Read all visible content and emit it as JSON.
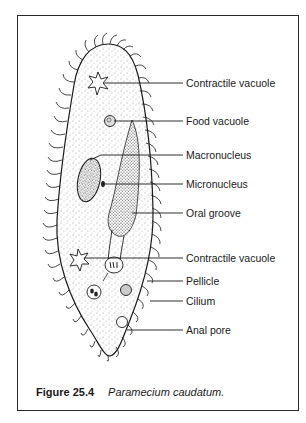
{
  "figure": {
    "number": "Figure 25.4",
    "title": "Paramecium caudatum."
  },
  "labels": [
    {
      "id": "contractile-vacuole-top",
      "text": "Contractile vacuole",
      "y": 83
    },
    {
      "id": "food-vacuole",
      "text": "Food vacuole",
      "y": 121
    },
    {
      "id": "macronucleus",
      "text": "Macronucleus",
      "y": 155
    },
    {
      "id": "micronucleus",
      "text": "Micronucleus",
      "y": 184
    },
    {
      "id": "oral-groove",
      "text": "Oral groove",
      "y": 213
    },
    {
      "id": "contractile-vacuole-bottom",
      "text": "Contractile vacuole",
      "y": 258
    },
    {
      "id": "pellicle",
      "text": "Pellicle",
      "y": 281
    },
    {
      "id": "cilium",
      "text": "Cilium",
      "y": 301
    },
    {
      "id": "anal-pore",
      "text": "Anal pore",
      "y": 330
    }
  ],
  "colors": {
    "ink": "#1a1a1a",
    "frame": "#2a2a2a",
    "background": "#ffffff"
  }
}
